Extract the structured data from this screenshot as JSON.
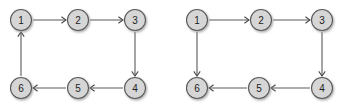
{
  "figure": {
    "background_color": "#ffffff",
    "node_fill_color": "#d6d6d6",
    "node_stroke_color": "#5a5a5a",
    "edge_color": "#5a5a5a",
    "label_color": "#1d1d1d",
    "node_radius": 10.5,
    "shadow_color": "#b0b0b0"
  },
  "graphs": [
    {
      "id": "left-graph",
      "name": "directed-cycle-graph-left",
      "nodes": [
        {
          "id": "1",
          "label": "1",
          "cx": 21,
          "cy": 20
        },
        {
          "id": "2",
          "label": "2",
          "cx": 78,
          "cy": 20
        },
        {
          "id": "3",
          "label": "3",
          "cx": 135,
          "cy": 20
        },
        {
          "id": "4",
          "label": "4",
          "cx": 135,
          "cy": 88
        },
        {
          "id": "5",
          "label": "5",
          "cx": 78,
          "cy": 88
        },
        {
          "id": "6",
          "label": "6",
          "cx": 21,
          "cy": 88
        }
      ],
      "edges": [
        {
          "from": "1",
          "to": "2",
          "direction": "right"
        },
        {
          "from": "2",
          "to": "3",
          "direction": "right"
        },
        {
          "from": "3",
          "to": "4",
          "direction": "down"
        },
        {
          "from": "4",
          "to": "5",
          "direction": "left"
        },
        {
          "from": "5",
          "to": "6",
          "direction": "left"
        },
        {
          "from": "6",
          "to": "1",
          "direction": "up"
        }
      ]
    },
    {
      "id": "right-graph",
      "name": "directed-path-graph-right",
      "nodes": [
        {
          "id": "1",
          "label": "1",
          "cx": 197,
          "cy": 20
        },
        {
          "id": "2",
          "label": "2",
          "cx": 261,
          "cy": 20
        },
        {
          "id": "3",
          "label": "3",
          "cx": 322,
          "cy": 20
        },
        {
          "id": "4",
          "label": "4",
          "cx": 322,
          "cy": 88
        },
        {
          "id": "5",
          "label": "5",
          "cx": 259,
          "cy": 88
        },
        {
          "id": "6",
          "label": "6",
          "cx": 197,
          "cy": 88
        }
      ],
      "edges": [
        {
          "from": "1",
          "to": "2",
          "direction": "right"
        },
        {
          "from": "2",
          "to": "3",
          "direction": "right"
        },
        {
          "from": "3",
          "to": "4",
          "direction": "down"
        },
        {
          "from": "4",
          "to": "5",
          "direction": "left"
        },
        {
          "from": "5",
          "to": "6",
          "direction": "left"
        },
        {
          "from": "1",
          "to": "6",
          "direction": "down"
        }
      ]
    }
  ]
}
